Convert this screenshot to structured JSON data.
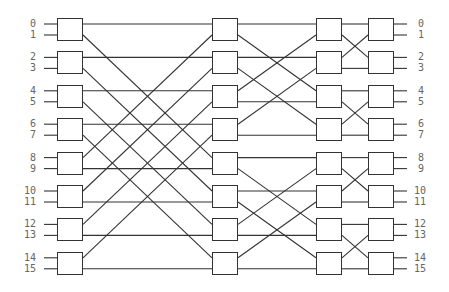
{
  "diagram": {
    "title": "",
    "type": "multistage interconnection network (butterfly / Omega-style)",
    "num_ports": 16,
    "num_stages": 4,
    "switches_per_stage": 8,
    "input_labels": [
      "0",
      "1",
      "2",
      "3",
      "4",
      "5",
      "6",
      "7",
      "8",
      "9",
      "10",
      "11",
      "12",
      "13",
      "14",
      "15"
    ],
    "output_labels": [
      "0",
      "1",
      "2",
      "3",
      "4",
      "5",
      "6",
      "7",
      "8",
      "9",
      "10",
      "11",
      "12",
      "13",
      "14",
      "15"
    ],
    "stages": [
      {
        "name": "stage-1",
        "x": 57,
        "spans_to_next": 4
      },
      {
        "name": "stage-2",
        "x": 212,
        "spans_to_next": 2
      },
      {
        "name": "stage-3",
        "x": 316,
        "spans_to_next": 1
      },
      {
        "name": "stage-4",
        "x": 368,
        "spans_to_next": null
      }
    ],
    "colors": {
      "line": "#333333",
      "box_border": "#333333",
      "label": "#666666",
      "background": "#ffffff"
    }
  }
}
